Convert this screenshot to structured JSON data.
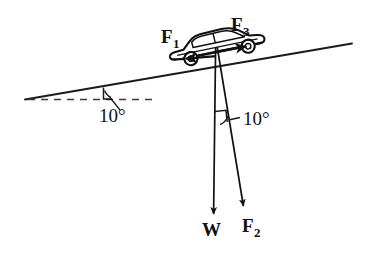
{
  "figure": {
    "background_color": "#ffffff",
    "stroke_color": "#1a1a1a",
    "width": 377,
    "height": 254
  },
  "labels": {
    "f1": "F",
    "f1_sub": "1",
    "f3": "F",
    "f3_sub": "3",
    "w": "W",
    "f2": "F",
    "f2_sub": "2",
    "angle_incline": "10°",
    "angle_vectors": "10°"
  },
  "geometry": {
    "incline": {
      "x1": 25,
      "y1": 99,
      "x2": 352,
      "y2": 44,
      "angle_deg": 10
    },
    "horizontal_dashed": {
      "x1": 28,
      "y1": 99,
      "x2": 152,
      "y2": 99,
      "dash": "7 6"
    },
    "angle_tick_incline": {
      "x": 103,
      "y_top": 88,
      "y_bottom": 99
    },
    "origin": {
      "x": 216,
      "y": 46
    },
    "vectors": [
      {
        "name": "F1",
        "x1": 215,
        "y1": 56,
        "x2": 184,
        "y2": 58,
        "direction": "down-slope-left"
      },
      {
        "name": "F3",
        "x1": 215,
        "y1": 52,
        "x2": 248,
        "y2": 46,
        "direction": "up-slope-right"
      },
      {
        "name": "W",
        "x1": 215,
        "y1": 47,
        "x2": 213,
        "y2": 219,
        "direction": "straight-down"
      },
      {
        "name": "F2",
        "x1": 217,
        "y1": 47,
        "x2": 244,
        "y2": 211,
        "direction": "down-right-perpendicular"
      }
    ],
    "angle_marker_vectors": {
      "x": 215,
      "y": 112,
      "size": 12
    }
  },
  "car": {
    "name": "sedan-side-view",
    "rotation_deg": -10,
    "center_x": 216,
    "center_y": 45
  }
}
